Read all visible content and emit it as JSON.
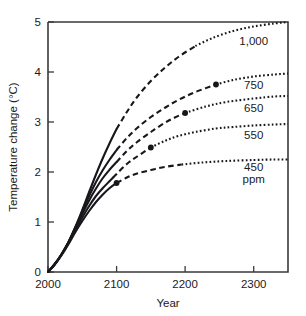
{
  "chart_data": {
    "type": "line",
    "title": "",
    "xlabel": "Year",
    "ylabel": "Temperature change (°C)",
    "xlim": [
      2000,
      2350
    ],
    "ylim": [
      0,
      5
    ],
    "xticks": [
      2000,
      2100,
      2200,
      2300
    ],
    "xtick_labels": [
      "2000",
      "2100",
      "2200",
      "2300"
    ],
    "yticks": [
      0,
      1,
      2,
      3,
      4,
      5
    ],
    "ytick_labels": [
      "0",
      "1",
      "2",
      "3",
      "4",
      "5"
    ],
    "grid": false,
    "legend_position": "right-inline",
    "units_note": "ppm",
    "line_styles": {
      "historical": "solid",
      "near_term": "dashed",
      "long_term": "dotted"
    },
    "series": [
      {
        "name": "1,000",
        "label": "1,000",
        "label_x": 2300,
        "label_y": 4.55,
        "marker": null,
        "solid_end_year": 2100,
        "dashed_end_year": 2215,
        "points": [
          [
            2000,
            0.0
          ],
          [
            2010,
            0.16
          ],
          [
            2020,
            0.36
          ],
          [
            2030,
            0.6
          ],
          [
            2040,
            0.9
          ],
          [
            2050,
            1.24
          ],
          [
            2060,
            1.6
          ],
          [
            2070,
            1.95
          ],
          [
            2080,
            2.28
          ],
          [
            2090,
            2.58
          ],
          [
            2100,
            2.86
          ],
          [
            2115,
            3.2
          ],
          [
            2130,
            3.5
          ],
          [
            2150,
            3.82
          ],
          [
            2170,
            4.08
          ],
          [
            2190,
            4.3
          ],
          [
            2215,
            4.52
          ],
          [
            2240,
            4.68
          ],
          [
            2270,
            4.82
          ],
          [
            2300,
            4.91
          ],
          [
            2330,
            4.97
          ],
          [
            2350,
            5.0
          ]
        ]
      },
      {
        "name": "750",
        "label": "750",
        "label_x": 2300,
        "label_y": 3.66,
        "marker": {
          "year": 2245,
          "value": 3.75
        },
        "solid_end_year": 2100,
        "dashed_end_year": 2245,
        "points": [
          [
            2000,
            0.0
          ],
          [
            2010,
            0.16
          ],
          [
            2020,
            0.36
          ],
          [
            2030,
            0.6
          ],
          [
            2040,
            0.9
          ],
          [
            2050,
            1.21
          ],
          [
            2060,
            1.52
          ],
          [
            2070,
            1.8
          ],
          [
            2080,
            2.04
          ],
          [
            2090,
            2.25
          ],
          [
            2100,
            2.44
          ],
          [
            2115,
            2.68
          ],
          [
            2130,
            2.88
          ],
          [
            2150,
            3.1
          ],
          [
            2170,
            3.28
          ],
          [
            2190,
            3.44
          ],
          [
            2215,
            3.6
          ],
          [
            2245,
            3.75
          ],
          [
            2270,
            3.84
          ],
          [
            2300,
            3.91
          ],
          [
            2330,
            3.95
          ],
          [
            2350,
            3.97
          ]
        ]
      },
      {
        "name": "650",
        "label": "650",
        "label_x": 2300,
        "label_y": 3.21,
        "marker": {
          "year": 2200,
          "value": 3.18
        },
        "solid_end_year": 2100,
        "dashed_end_year": 2200,
        "points": [
          [
            2000,
            0.0
          ],
          [
            2010,
            0.16
          ],
          [
            2020,
            0.36
          ],
          [
            2030,
            0.6
          ],
          [
            2040,
            0.88
          ],
          [
            2050,
            1.16
          ],
          [
            2060,
            1.43
          ],
          [
            2070,
            1.67
          ],
          [
            2080,
            1.88
          ],
          [
            2090,
            2.05
          ],
          [
            2100,
            2.2
          ],
          [
            2115,
            2.42
          ],
          [
            2130,
            2.6
          ],
          [
            2150,
            2.8
          ],
          [
            2170,
            2.98
          ],
          [
            2185,
            3.09
          ],
          [
            2200,
            3.18
          ],
          [
            2230,
            3.31
          ],
          [
            2260,
            3.4
          ],
          [
            2300,
            3.47
          ],
          [
            2330,
            3.51
          ],
          [
            2350,
            3.52
          ]
        ]
      },
      {
        "name": "550",
        "label": "550",
        "label_x": 2300,
        "label_y": 2.66,
        "marker": {
          "year": 2150,
          "value": 2.49
        },
        "solid_end_year": 2095,
        "dashed_end_year": 2150,
        "points": [
          [
            2000,
            0.0
          ],
          [
            2010,
            0.16
          ],
          [
            2020,
            0.35
          ],
          [
            2030,
            0.58
          ],
          [
            2040,
            0.84
          ],
          [
            2050,
            1.09
          ],
          [
            2060,
            1.32
          ],
          [
            2070,
            1.52
          ],
          [
            2080,
            1.68
          ],
          [
            2090,
            1.82
          ],
          [
            2100,
            1.96
          ],
          [
            2115,
            2.16
          ],
          [
            2130,
            2.31
          ],
          [
            2150,
            2.49
          ],
          [
            2170,
            2.62
          ],
          [
            2190,
            2.72
          ],
          [
            2215,
            2.8
          ],
          [
            2245,
            2.87
          ],
          [
            2270,
            2.9
          ],
          [
            2300,
            2.93
          ],
          [
            2330,
            2.95
          ],
          [
            2350,
            2.96
          ]
        ]
      },
      {
        "name": "450",
        "label": "450",
        "label_x": 2300,
        "label_y": 2.03,
        "marker": {
          "year": 2100,
          "value": 1.78
        },
        "solid_end_year": 2100,
        "dashed_end_year": 2195,
        "points": [
          [
            2000,
            0.0
          ],
          [
            2010,
            0.15
          ],
          [
            2020,
            0.34
          ],
          [
            2030,
            0.56
          ],
          [
            2040,
            0.8
          ],
          [
            2050,
            1.02
          ],
          [
            2060,
            1.22
          ],
          [
            2070,
            1.4
          ],
          [
            2080,
            1.55
          ],
          [
            2090,
            1.68
          ],
          [
            2100,
            1.78
          ],
          [
            2115,
            1.89
          ],
          [
            2130,
            1.97
          ],
          [
            2150,
            2.04
          ],
          [
            2170,
            2.1
          ],
          [
            2195,
            2.15
          ],
          [
            2225,
            2.19
          ],
          [
            2260,
            2.22
          ],
          [
            2300,
            2.24
          ],
          [
            2330,
            2.25
          ],
          [
            2350,
            2.25
          ]
        ]
      }
    ],
    "annotations": [
      {
        "text": "ppm",
        "x": 2300,
        "y": 1.78
      }
    ]
  }
}
